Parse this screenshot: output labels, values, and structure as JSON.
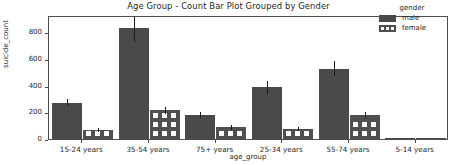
{
  "chart_data": {
    "type": "bar",
    "title": "Age Group - Count Bar Plot Grouped by Gender",
    "xlabel": "age_group",
    "ylabel": "suicide_count",
    "categories": [
      "15-24 years",
      "35-54 years",
      "75+ years",
      "25-34 years",
      "55-74 years",
      "5-14 years"
    ],
    "series": [
      {
        "name": "male",
        "values": [
          272,
          830,
          180,
          388,
          528,
          10
        ],
        "errors": [
          28,
          100,
          22,
          48,
          55,
          4
        ],
        "color": "#4a4a4a"
      },
      {
        "name": "female",
        "values": [
          68,
          215,
          88,
          78,
          178,
          2
        ],
        "errors": [
          13,
          25,
          17,
          15,
          22,
          2
        ],
        "color": "#4f4f4f"
      }
    ],
    "yticks": [
      0,
      200,
      400,
      600,
      800
    ],
    "ylim": [
      0,
      930
    ],
    "grid": false,
    "legend": {
      "title": "gender",
      "position": "upper right",
      "entries": [
        "male",
        "female"
      ]
    }
  },
  "legend": {
    "title": "gender",
    "items": [
      {
        "label": "male",
        "swatch": "solid-dark-swatch"
      },
      {
        "label": "female",
        "swatch": "hatched-dark-swatch"
      }
    ]
  },
  "yaxis": {
    "label": "suicide_count",
    "ticks": [
      "0",
      "200",
      "400",
      "600",
      "800"
    ]
  },
  "xaxis": {
    "label": "age_group",
    "ticks": [
      "15-24 years",
      "35-54 years",
      "75+ years",
      "25-34 years",
      "55-74 years",
      "5-14 years"
    ]
  },
  "title": "Age Group - Count Bar Plot Grouped by Gender"
}
